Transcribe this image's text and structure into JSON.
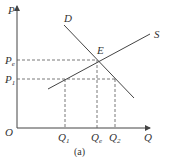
{
  "diagram": {
    "type": "supply-demand",
    "caption": "(a)",
    "axes": {
      "y_label": "P",
      "x_label": "Q",
      "origin_label": "O"
    },
    "curves": {
      "demand_label": "D",
      "supply_label": "S"
    },
    "equilibrium_label": "E",
    "price_labels": {
      "pe_main": "P",
      "pe_sub": "e",
      "p1_main": "P",
      "p1_sub": "1"
    },
    "quantity_labels": {
      "q1_main": "Q",
      "q1_sub": "1",
      "qe_main": "Q",
      "qe_sub": "e",
      "q2_main": "Q",
      "q2_sub": "2"
    },
    "colors": {
      "line": "#444444",
      "text": "#333333"
    }
  }
}
